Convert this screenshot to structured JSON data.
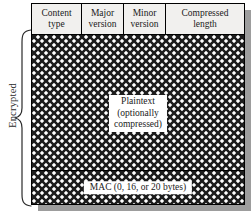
{
  "figure": {
    "name": "ssl-tls-record-format",
    "encrypted_bracket_label": "Encrypted",
    "header": {
      "fields": [
        {
          "line1": "Content",
          "line2": "type"
        },
        {
          "line1": "Major",
          "line2": "version"
        },
        {
          "line1": "Minor",
          "line2": "version"
        },
        {
          "line1": "Compressed",
          "line2": "length"
        }
      ]
    },
    "body": {
      "plaintext_label": {
        "line1": "Plaintext",
        "line2": "(optionally",
        "line3": "compressed)"
      },
      "mac_label": "MAC (0, 16, or 20 bytes)"
    },
    "colors": {
      "outline": "#000000",
      "header_fill": "#f1f0ee",
      "hatch_stroke": "#1c1c1c",
      "hatch_background": "#ffffff",
      "shadow": "#9d9d9d",
      "text": "#1a1a1a"
    }
  }
}
